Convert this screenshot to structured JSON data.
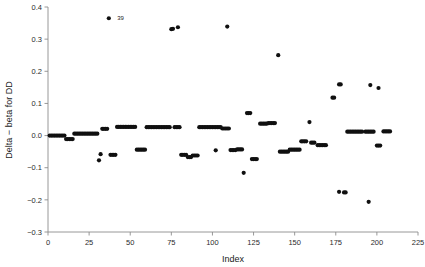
{
  "chart_data": {
    "type": "scatter",
    "title": "",
    "xlabel": "Index",
    "ylabel": "Delta − beta for DD",
    "xlim": [
      0,
      225
    ],
    "ylim": [
      -0.3,
      0.4
    ],
    "xticks": [
      0,
      25,
      50,
      75,
      100,
      125,
      150,
      175,
      200,
      225
    ],
    "xticklabels": [
      "0",
      "25",
      "50",
      "75",
      "100",
      "125",
      "150",
      "175",
      "200",
      "225"
    ],
    "yticks": [
      -0.3,
      -0.2,
      -0.1,
      0.0,
      0.1,
      0.2,
      0.3,
      0.4
    ],
    "yticklabels": [
      "−0.3",
      "−0.2",
      "−0.1",
      "0.0",
      "0.1",
      "0.2",
      "0.3",
      "0.4"
    ],
    "grid": false,
    "legend": null,
    "marker": "filled-circle",
    "marker_color": "#101010",
    "marker_size": 2.1,
    "annotations": [
      {
        "text": "39",
        "x": 39,
        "y": 0.365,
        "dx": 5,
        "dy": 0
      }
    ],
    "series": [
      {
        "name": "Delta-beta for DD",
        "points": [
          [
            1,
            0.0
          ],
          [
            2,
            0.0
          ],
          [
            3,
            0.0
          ],
          [
            4,
            0.0
          ],
          [
            5,
            0.0
          ],
          [
            6,
            0.0
          ],
          [
            7,
            0.0
          ],
          [
            8,
            0.0
          ],
          [
            9,
            0.0
          ],
          [
            10,
            0.0
          ],
          [
            11,
            -0.011
          ],
          [
            12,
            -0.011
          ],
          [
            13,
            -0.011
          ],
          [
            14,
            -0.011
          ],
          [
            15,
            -0.011
          ],
          [
            16,
            0.006
          ],
          [
            17,
            0.006
          ],
          [
            18,
            0.006
          ],
          [
            19,
            0.006
          ],
          [
            20,
            0.006
          ],
          [
            21,
            0.006
          ],
          [
            22,
            0.006
          ],
          [
            23,
            0.006
          ],
          [
            24,
            0.006
          ],
          [
            25,
            0.006
          ],
          [
            26,
            0.006
          ],
          [
            27,
            0.006
          ],
          [
            28,
            0.006
          ],
          [
            29,
            0.006
          ],
          [
            30,
            0.006
          ],
          [
            31,
            -0.077
          ],
          [
            32,
            -0.058
          ],
          [
            33,
            0.021
          ],
          [
            34,
            0.021
          ],
          [
            35,
            0.021
          ],
          [
            36,
            0.021
          ],
          [
            37,
            0.365
          ],
          [
            38,
            -0.06
          ],
          [
            39,
            -0.06
          ],
          [
            40,
            -0.06
          ],
          [
            41,
            -0.06
          ],
          [
            42,
            0.027
          ],
          [
            43,
            0.027
          ],
          [
            44,
            0.027
          ],
          [
            45,
            0.027
          ],
          [
            46,
            0.027
          ],
          [
            47,
            0.027
          ],
          [
            48,
            0.027
          ],
          [
            49,
            0.027
          ],
          [
            50,
            0.027
          ],
          [
            51,
            0.027
          ],
          [
            52,
            0.027
          ],
          [
            53,
            0.027
          ],
          [
            54,
            -0.044
          ],
          [
            55,
            -0.044
          ],
          [
            56,
            -0.044
          ],
          [
            57,
            -0.044
          ],
          [
            58,
            -0.044
          ],
          [
            59,
            -0.044
          ],
          [
            60,
            0.026
          ],
          [
            61,
            0.026
          ],
          [
            62,
            0.026
          ],
          [
            63,
            0.026
          ],
          [
            64,
            0.026
          ],
          [
            65,
            0.026
          ],
          [
            66,
            0.026
          ],
          [
            67,
            0.026
          ],
          [
            68,
            0.026
          ],
          [
            69,
            0.026
          ],
          [
            70,
            0.026
          ],
          [
            71,
            0.026
          ],
          [
            72,
            0.026
          ],
          [
            73,
            0.026
          ],
          [
            74,
            0.026
          ],
          [
            75,
            0.331
          ],
          [
            76,
            0.332
          ],
          [
            77,
            0.026
          ],
          [
            78,
            0.026
          ],
          [
            79,
            0.026
          ],
          [
            80,
            0.026
          ],
          [
            79,
            0.337
          ],
          [
            81,
            -0.06
          ],
          [
            82,
            -0.06
          ],
          [
            83,
            -0.06
          ],
          [
            84,
            -0.06
          ],
          [
            85,
            -0.067
          ],
          [
            86,
            -0.067
          ],
          [
            87,
            -0.067
          ],
          [
            88,
            -0.062
          ],
          [
            89,
            -0.062
          ],
          [
            90,
            -0.062
          ],
          [
            91,
            -0.062
          ],
          [
            92,
            0.026
          ],
          [
            93,
            0.026
          ],
          [
            94,
            0.026
          ],
          [
            95,
            0.026
          ],
          [
            96,
            0.026
          ],
          [
            97,
            0.026
          ],
          [
            98,
            0.026
          ],
          [
            99,
            0.026
          ],
          [
            100,
            0.026
          ],
          [
            101,
            0.026
          ],
          [
            102,
            0.026
          ],
          [
            103,
            0.026
          ],
          [
            104,
            0.026
          ],
          [
            105,
            0.026
          ],
          [
            102,
            -0.046
          ],
          [
            106,
            0.022
          ],
          [
            107,
            0.022
          ],
          [
            108,
            0.022
          ],
          [
            109,
            0.022
          ],
          [
            110,
            0.022
          ],
          [
            109,
            0.339
          ],
          [
            111,
            -0.045
          ],
          [
            112,
            -0.045
          ],
          [
            113,
            -0.045
          ],
          [
            114,
            -0.045
          ],
          [
            115,
            -0.043
          ],
          [
            116,
            -0.043
          ],
          [
            117,
            -0.043
          ],
          [
            118,
            -0.043
          ],
          [
            119,
            -0.116
          ],
          [
            121,
            0.07
          ],
          [
            122,
            0.07
          ],
          [
            123,
            0.07
          ],
          [
            124,
            -0.073
          ],
          [
            125,
            -0.073
          ],
          [
            126,
            -0.073
          ],
          [
            127,
            -0.073
          ],
          [
            129,
            0.037
          ],
          [
            130,
            0.037
          ],
          [
            131,
            0.037
          ],
          [
            132,
            0.037
          ],
          [
            133,
            0.037
          ],
          [
            134,
            0.039
          ],
          [
            135,
            0.039
          ],
          [
            136,
            0.039
          ],
          [
            137,
            0.039
          ],
          [
            138,
            0.039
          ],
          [
            140,
            0.25
          ],
          [
            141,
            -0.05
          ],
          [
            142,
            -0.05
          ],
          [
            143,
            -0.05
          ],
          [
            144,
            -0.05
          ],
          [
            145,
            -0.05
          ],
          [
            146,
            -0.05
          ],
          [
            147,
            -0.044
          ],
          [
            148,
            -0.044
          ],
          [
            149,
            -0.044
          ],
          [
            150,
            -0.044
          ],
          [
            151,
            -0.044
          ],
          [
            152,
            -0.044
          ],
          [
            153,
            -0.044
          ],
          [
            154,
            -0.018
          ],
          [
            155,
            -0.018
          ],
          [
            156,
            -0.018
          ],
          [
            157,
            -0.018
          ],
          [
            159,
            0.042
          ],
          [
            160,
            -0.022
          ],
          [
            161,
            -0.022
          ],
          [
            162,
            -0.022
          ],
          [
            164,
            -0.03
          ],
          [
            165,
            -0.03
          ],
          [
            166,
            -0.03
          ],
          [
            167,
            -0.03
          ],
          [
            168,
            -0.03
          ],
          [
            169,
            -0.03
          ],
          [
            173,
            0.118
          ],
          [
            174,
            0.118
          ],
          [
            177,
            0.159
          ],
          [
            178,
            0.159
          ],
          [
            177,
            -0.175
          ],
          [
            180,
            -0.177
          ],
          [
            181,
            -0.177
          ],
          [
            182,
            0.012
          ],
          [
            183,
            0.012
          ],
          [
            184,
            0.012
          ],
          [
            185,
            0.012
          ],
          [
            186,
            0.012
          ],
          [
            187,
            0.012
          ],
          [
            188,
            0.012
          ],
          [
            189,
            0.012
          ],
          [
            190,
            0.012
          ],
          [
            191,
            0.012
          ],
          [
            193,
            0.012
          ],
          [
            194,
            0.012
          ],
          [
            195,
            0.012
          ],
          [
            196,
            0.012
          ],
          [
            197,
            0.012
          ],
          [
            198,
            0.012
          ],
          [
            196,
            0.157
          ],
          [
            195,
            -0.206
          ],
          [
            201,
            0.148
          ],
          [
            200,
            -0.031
          ],
          [
            201,
            -0.031
          ],
          [
            202,
            -0.031
          ],
          [
            204,
            0.013
          ],
          [
            205,
            0.013
          ],
          [
            206,
            0.013
          ],
          [
            207,
            0.013
          ],
          [
            208,
            0.013
          ]
        ]
      }
    ]
  },
  "figure": {
    "xlabel_text": "Index",
    "ylabel_text": "Delta − beta for DD"
  }
}
